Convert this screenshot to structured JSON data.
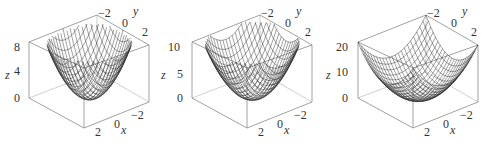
{
  "chart_data": [
    {
      "type": "surface3d",
      "title": "",
      "function": "z = x^2 + y^2",
      "xlabel": "x",
      "ylabel": "y",
      "zlabel": "z",
      "x_ticks": [
        "2",
        "0",
        "−2"
      ],
      "y_ticks": [
        "−2",
        "0",
        "2"
      ],
      "z_ticks": [
        "0",
        "4",
        "8"
      ],
      "xlim": [
        -2,
        2
      ],
      "ylim": [
        -2,
        2
      ],
      "zlim": [
        0,
        8
      ],
      "shape": "paraboloid, narrow bowl"
    },
    {
      "type": "surface3d",
      "title": "",
      "function": "z = x^2 + y^2 (wider domain)",
      "xlabel": "x",
      "ylabel": "y",
      "zlabel": "z",
      "x_ticks": [
        "2",
        "0",
        "−2"
      ],
      "y_ticks": [
        "−2",
        "0",
        "2"
      ],
      "z_ticks": [
        "0",
        "5",
        "10"
      ],
      "xlim": [
        -2,
        2
      ],
      "ylim": [
        -2,
        2
      ],
      "zlim": [
        0,
        10
      ],
      "shape": "paraboloid, medium bowl"
    },
    {
      "type": "surface3d",
      "title": "",
      "function": "z = x^2 + y^2 (square domain)",
      "xlabel": "x",
      "ylabel": "y",
      "zlabel": "z",
      "x_ticks": [
        "2",
        "0",
        "−2"
      ],
      "y_ticks": [
        "−2",
        "0",
        "2"
      ],
      "z_ticks": [
        "0",
        "10",
        "20"
      ],
      "xlim": [
        -3,
        3
      ],
      "ylim": [
        -3,
        3
      ],
      "zlim": [
        0,
        20
      ],
      "shape": "paraboloid, wide bowl"
    }
  ],
  "panels": [
    {
      "zlabel": "z",
      "xlabel": "x",
      "ylabel": "y",
      "zticks": [
        "8",
        "4",
        "0"
      ],
      "xticks": [
        "2",
        "0",
        "−2"
      ],
      "yticks": [
        "−2",
        "0",
        "2"
      ]
    },
    {
      "zlabel": "z",
      "xlabel": "x",
      "ylabel": "y",
      "zticks": [
        "10",
        "5",
        "0"
      ],
      "xticks": [
        "2",
        "0",
        "−2"
      ],
      "yticks": [
        "−2",
        "0",
        "2"
      ]
    },
    {
      "zlabel": "z",
      "xlabel": "x",
      "ylabel": "y",
      "zticks": [
        "20",
        "10",
        "0"
      ],
      "xticks": [
        "2",
        "0",
        "−2"
      ],
      "yticks": [
        "−2",
        "0",
        "2"
      ]
    }
  ]
}
